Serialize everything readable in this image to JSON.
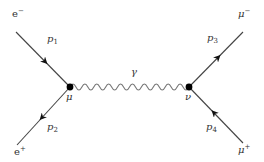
{
  "diagram": {
    "type": "Feynman diagram",
    "colors": {
      "line": "#444444",
      "photon": "#777777",
      "text": "#333333",
      "vertex": "#000000"
    },
    "vertices": [
      {
        "id": "mu",
        "label": "μ",
        "x": 70,
        "y": 87
      },
      {
        "id": "nu",
        "label": "ν",
        "x": 189,
        "y": 87
      }
    ],
    "external_particles": [
      {
        "id": "e_minus",
        "base": "e",
        "sup": "−",
        "x": 16,
        "y": 32,
        "momentum": {
          "base": "p",
          "sub": "1"
        },
        "arrow": "toward-vertex"
      },
      {
        "id": "e_plus",
        "base": "e",
        "sup": "+",
        "x": 17,
        "y": 145,
        "momentum": {
          "base": "p",
          "sub": "2"
        },
        "arrow": "away-from-vertex"
      },
      {
        "id": "mu_minus",
        "base": "μ",
        "sup": "−",
        "x": 243,
        "y": 32,
        "momentum": {
          "base": "p",
          "sub": "3"
        },
        "arrow": "away-from-vertex"
      },
      {
        "id": "mu_plus",
        "base": "μ",
        "sup": "+",
        "x": 243,
        "y": 143,
        "momentum": {
          "base": "p",
          "sub": "4"
        },
        "arrow": "toward-vertex"
      }
    ],
    "propagator": {
      "label": "γ",
      "kind": "photon-wavy",
      "periods": 10,
      "amplitude": 3
    }
  }
}
